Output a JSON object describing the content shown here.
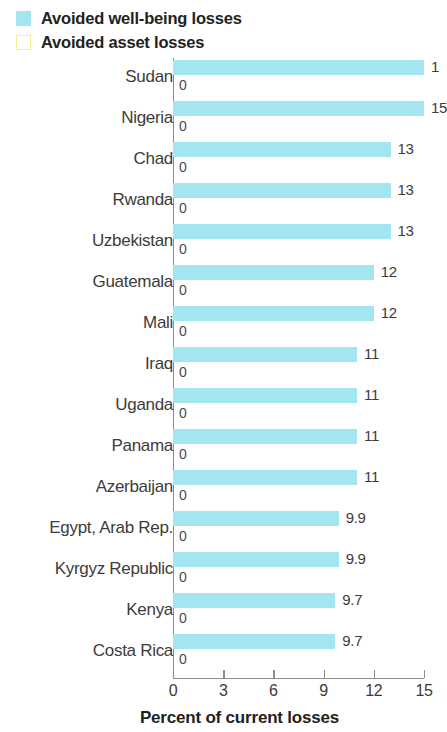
{
  "legend": {
    "items": [
      {
        "label": "Avoided well-being losses",
        "color": "#a3e6f2",
        "style": "filled",
        "name": "wellbeing"
      },
      {
        "label": "Avoided asset losses",
        "color": "#f2ef9a",
        "style": "outlined",
        "name": "asset"
      }
    ]
  },
  "axis": {
    "x_title": "Percent of current losses",
    "x_ticks": [
      "0",
      "3",
      "6",
      "9",
      "12",
      "15"
    ]
  },
  "chart_data": {
    "type": "bar",
    "orientation": "horizontal",
    "title": "",
    "subtitle": "",
    "xlabel": "Percent of current losses",
    "ylabel": "",
    "xlim": [
      0,
      15
    ],
    "xticks": [
      0,
      3,
      6,
      9,
      12,
      15
    ],
    "grid": false,
    "legend_position": "top-left",
    "categories": [
      "Sudan",
      "Nigeria",
      "Chad",
      "Rwanda",
      "Uzbekistan",
      "Guatemala",
      "Mali",
      "Iraq",
      "Uganda",
      "Panama",
      "Azerbaijan",
      "Egypt, Arab Rep.",
      "Kyrgyz Republic",
      "Kenya",
      "Costa Rica"
    ],
    "series": [
      {
        "name": "Avoided well-being losses",
        "color": "#a3e6f2",
        "values": [
          15,
          15,
          13,
          13,
          13,
          12,
          12,
          11,
          11,
          11,
          11,
          9.9,
          9.9,
          9.7,
          9.7
        ],
        "labels": [
          "1",
          "15",
          "13",
          "13",
          "13",
          "12",
          "12",
          "11",
          "11",
          "11",
          "11",
          "9.9",
          "9.9",
          "9.7",
          "9.7"
        ],
        "labels_clipped": [
          true,
          true,
          false,
          false,
          false,
          false,
          false,
          false,
          false,
          false,
          false,
          false,
          false,
          false,
          false
        ]
      },
      {
        "name": "Avoided asset losses",
        "color": "#f2ef9a",
        "values": [
          0,
          0,
          0,
          0,
          0,
          0,
          0,
          0,
          0,
          0,
          0,
          0,
          0,
          0,
          0
        ],
        "labels": [
          "0",
          "0",
          "0",
          "0",
          "0",
          "0",
          "0",
          "0",
          "0",
          "0",
          "0",
          "0",
          "0",
          "0",
          "0"
        ]
      }
    ]
  }
}
